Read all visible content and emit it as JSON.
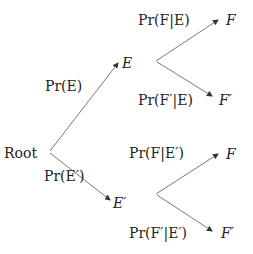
{
  "nodes": {
    "root": "Root",
    "e": "E",
    "e_prime": "E′",
    "f_from_e": "F",
    "fp_from_e": "F′",
    "f_from_ep": "F",
    "fp_from_ep": "F′"
  },
  "edges": {
    "root_to_e": "Pr(E)",
    "root_to_ep": "Pr(E′)",
    "e_to_f": "Pr(F|E)",
    "e_to_fp": "Pr(F′|E)",
    "ep_to_f": "Pr(F|E′)",
    "ep_to_fp": "Pr(F′|E′)"
  },
  "colors": {
    "line": "#444444",
    "text": "#222222"
  }
}
